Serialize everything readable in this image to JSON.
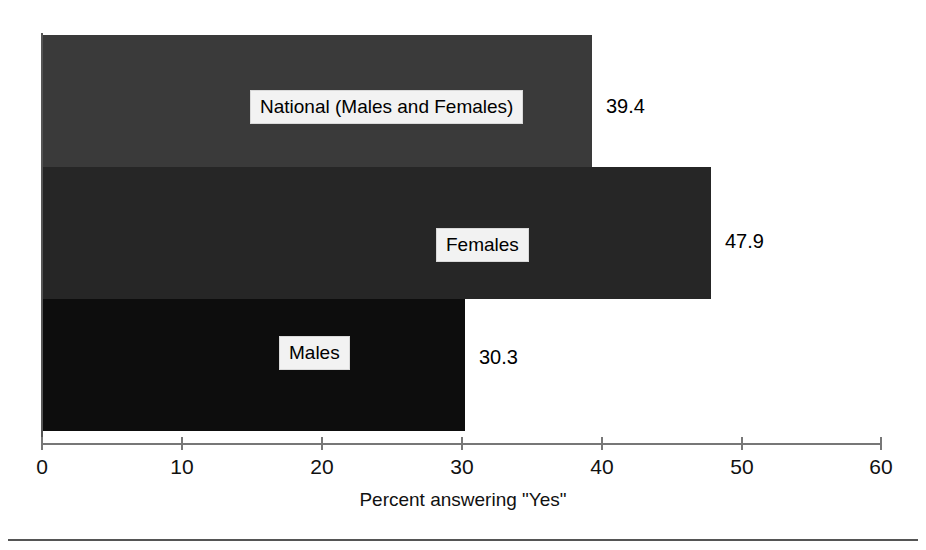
{
  "chart_data": {
    "type": "bar",
    "orientation": "horizontal",
    "title": "",
    "xlabel": "Percent answering \"Yes\"",
    "ylabel": "",
    "xlim": [
      0,
      60
    ],
    "xticks": [
      "0",
      "10",
      "20",
      "30",
      "40",
      "50",
      "60"
    ],
    "grid": false,
    "legend": "none",
    "categories": [
      "National (Males and Females)",
      "Females",
      "Males"
    ],
    "values": [
      39.4,
      47.9,
      30.3
    ],
    "value_labels": [
      "39.4",
      "47.9",
      "30.3"
    ],
    "bar_colors": [
      "#3a3a3a",
      "#262626",
      "#0d0d0d"
    ]
  },
  "axis": {
    "x_title": "Percent answering \"Yes\"",
    "ticks": [
      {
        "label": "0",
        "value": 0
      },
      {
        "label": "10",
        "value": 10
      },
      {
        "label": "20",
        "value": 20
      },
      {
        "label": "30",
        "value": 30
      },
      {
        "label": "40",
        "value": 40
      },
      {
        "label": "50",
        "value": 50
      },
      {
        "label": "60",
        "value": 60
      }
    ]
  },
  "bars": [
    {
      "label": "National (Males and Females)",
      "value_label": "39.4"
    },
    {
      "label": "Females",
      "value_label": "47.9"
    },
    {
      "label": "Males",
      "value_label": "30.3"
    }
  ]
}
